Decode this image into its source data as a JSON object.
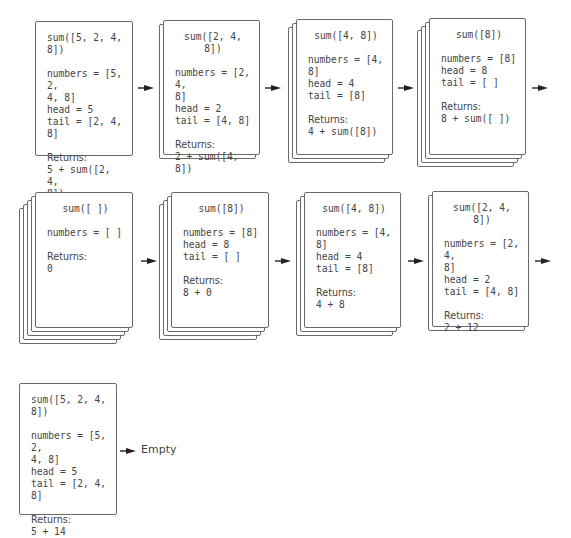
{
  "diagram": {
    "returns_label": "Returns:",
    "end_label": "Empty",
    "frames": [
      {
        "title": "sum([5, 2, 4, 8])",
        "lines": [
          "numbers = [5, 2,",
          "4, 8]",
          "head = 5",
          "tail = [2, 4, 8]"
        ],
        "returns": [
          "5 + sum([2, 4,",
          "8])"
        ]
      },
      {
        "title": "sum([2, 4, 8])",
        "lines": [
          "numbers = [2, 4,",
          "8]",
          "head = 2",
          "tail = [4, 8]"
        ],
        "returns": [
          "2 + sum([4, 8])"
        ]
      },
      {
        "title": "sum([4, 8])",
        "lines": [
          "numbers = [4, 8]",
          "head = 4",
          "tail = [8]"
        ],
        "returns": [
          "4 + sum([8])"
        ]
      },
      {
        "title": "sum([8])",
        "lines": [
          "numbers = [8]",
          "head = 8",
          "tail = [ ]"
        ],
        "returns": [
          "8 + sum([ ])"
        ]
      },
      {
        "title": "sum([ ])",
        "lines": [
          "numbers = [ ]"
        ],
        "returns": [
          "0"
        ]
      },
      {
        "title": "sum([8])",
        "lines": [
          "numbers = [8]",
          "head = 8",
          "tail = [ ]"
        ],
        "returns": [
          "8 + 0"
        ]
      },
      {
        "title": "sum([4, 8])",
        "lines": [
          "numbers = [4, 8]",
          "head = 4",
          "tail = [8]"
        ],
        "returns": [
          "4 + 8"
        ]
      },
      {
        "title": "sum([2, 4, 8])",
        "lines": [
          "numbers = [2, 4,",
          "8]",
          "head = 2",
          "tail = [4, 8]"
        ],
        "returns": [
          "2 + 12"
        ]
      },
      {
        "title": "sum([5, 2, 4, 8])",
        "lines": [
          "numbers = [5, 2,",
          "4, 8]",
          "head = 5",
          "tail = [2, 4, 8]"
        ],
        "returns": [
          "5 + 14"
        ]
      }
    ]
  }
}
